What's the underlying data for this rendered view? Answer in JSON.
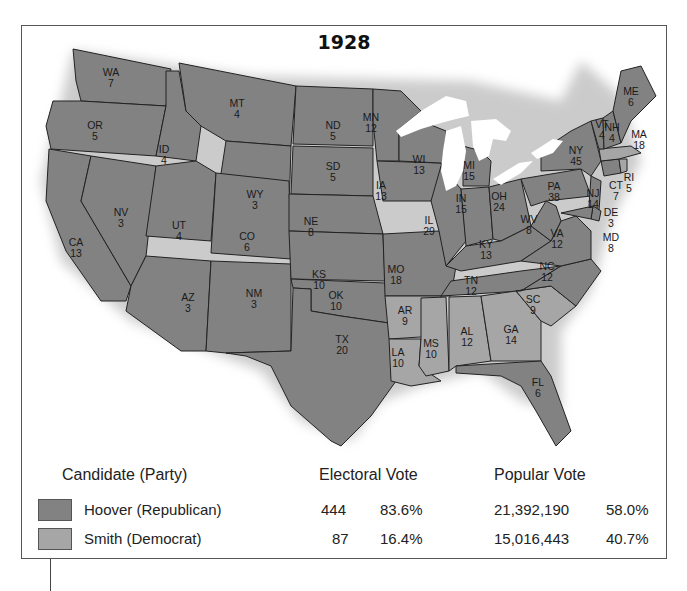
{
  "map": {
    "title": "1928",
    "colors": {
      "hoover": "#828282",
      "smith": "#a6a6a6",
      "lakes": "#ffffff",
      "border": "#222222"
    },
    "states": [
      {
        "abbr": "WA",
        "ev": 7,
        "winner": "hoover"
      },
      {
        "abbr": "OR",
        "ev": 5,
        "winner": "hoover"
      },
      {
        "abbr": "CA",
        "ev": 13,
        "winner": "hoover"
      },
      {
        "abbr": "ID",
        "ev": 4,
        "winner": "hoover"
      },
      {
        "abbr": "NV",
        "ev": 3,
        "winner": "hoover"
      },
      {
        "abbr": "MT",
        "ev": 4,
        "winner": "hoover"
      },
      {
        "abbr": "WY",
        "ev": 3,
        "winner": "hoover"
      },
      {
        "abbr": "UT",
        "ev": 4,
        "winner": "hoover"
      },
      {
        "abbr": "AZ",
        "ev": 3,
        "winner": "hoover"
      },
      {
        "abbr": "CO",
        "ev": 6,
        "winner": "hoover"
      },
      {
        "abbr": "NM",
        "ev": 3,
        "winner": "hoover"
      },
      {
        "abbr": "ND",
        "ev": 5,
        "winner": "hoover"
      },
      {
        "abbr": "SD",
        "ev": 5,
        "winner": "hoover"
      },
      {
        "abbr": "NE",
        "ev": 8,
        "winner": "hoover"
      },
      {
        "abbr": "KS",
        "ev": 10,
        "winner": "hoover"
      },
      {
        "abbr": "OK",
        "ev": 10,
        "winner": "hoover"
      },
      {
        "abbr": "TX",
        "ev": 20,
        "winner": "hoover"
      },
      {
        "abbr": "MN",
        "ev": 12,
        "winner": "hoover"
      },
      {
        "abbr": "IA",
        "ev": 13,
        "winner": "hoover"
      },
      {
        "abbr": "MO",
        "ev": 18,
        "winner": "hoover"
      },
      {
        "abbr": "AR",
        "ev": 9,
        "winner": "smith"
      },
      {
        "abbr": "LA",
        "ev": 10,
        "winner": "smith"
      },
      {
        "abbr": "WI",
        "ev": 13,
        "winner": "hoover"
      },
      {
        "abbr": "IL",
        "ev": 29,
        "winner": "hoover"
      },
      {
        "abbr": "MI",
        "ev": 15,
        "winner": "hoover"
      },
      {
        "abbr": "IN",
        "ev": 15,
        "winner": "hoover"
      },
      {
        "abbr": "OH",
        "ev": 24,
        "winner": "hoover"
      },
      {
        "abbr": "KY",
        "ev": 13,
        "winner": "hoover"
      },
      {
        "abbr": "TN",
        "ev": 12,
        "winner": "hoover"
      },
      {
        "abbr": "MS",
        "ev": 10,
        "winner": "smith"
      },
      {
        "abbr": "AL",
        "ev": 12,
        "winner": "smith"
      },
      {
        "abbr": "GA",
        "ev": 14,
        "winner": "smith"
      },
      {
        "abbr": "FL",
        "ev": 6,
        "winner": "hoover"
      },
      {
        "abbr": "SC",
        "ev": 9,
        "winner": "smith"
      },
      {
        "abbr": "NC",
        "ev": 12,
        "winner": "hoover"
      },
      {
        "abbr": "VA",
        "ev": 12,
        "winner": "hoover"
      },
      {
        "abbr": "WV",
        "ev": 8,
        "winner": "hoover"
      },
      {
        "abbr": "PA",
        "ev": 38,
        "winner": "hoover"
      },
      {
        "abbr": "NY",
        "ev": 45,
        "winner": "hoover"
      },
      {
        "abbr": "NJ",
        "ev": 14,
        "winner": "hoover"
      },
      {
        "abbr": "DE",
        "ev": 3,
        "winner": "hoover"
      },
      {
        "abbr": "MD",
        "ev": 8,
        "winner": "hoover"
      },
      {
        "abbr": "CT",
        "ev": 7,
        "winner": "hoover"
      },
      {
        "abbr": "RI",
        "ev": 5,
        "winner": "smith"
      },
      {
        "abbr": "MA",
        "ev": 18,
        "winner": "smith"
      },
      {
        "abbr": "VT",
        "ev": 4,
        "winner": "hoover"
      },
      {
        "abbr": "NH",
        "ev": 4,
        "winner": "hoover"
      },
      {
        "abbr": "ME",
        "ev": 6,
        "winner": "hoover"
      }
    ]
  },
  "legend": {
    "headers": {
      "candidate": "Candidate (Party)",
      "electoral": "Electoral Vote",
      "popular": "Popular Vote"
    },
    "rows": [
      {
        "candidate": "Hoover (Republican)",
        "ev": "444",
        "ev_pct": "83.6%",
        "pop": "21,392,190",
        "pop_pct": "58.0%",
        "color": "#828282"
      },
      {
        "candidate": "Smith (Democrat)",
        "ev": "87",
        "ev_pct": "16.4%",
        "pop": "15,016,443",
        "pop_pct": "40.7%",
        "color": "#a6a6a6"
      }
    ]
  }
}
